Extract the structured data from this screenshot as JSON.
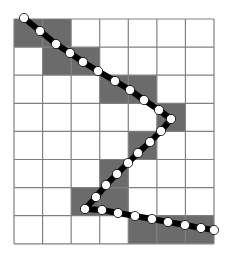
{
  "diagram": {
    "type": "grid-path",
    "grid": {
      "cols": 7,
      "rows": 8,
      "origin_x": 14,
      "origin_y": 19,
      "cell_w": 28.57,
      "cell_h": 28.1,
      "line_color": "#808080",
      "fill_color": "#ffffff",
      "shade_color": "#6b6b6b"
    },
    "shaded_cells": [
      [
        0,
        0
      ],
      [
        0,
        1
      ],
      [
        1,
        1
      ],
      [
        1,
        2
      ],
      [
        2,
        3
      ],
      [
        2,
        4
      ],
      [
        3,
        5
      ],
      [
        4,
        4
      ],
      [
        5,
        3
      ],
      [
        6,
        2
      ],
      [
        6,
        3
      ],
      [
        7,
        4
      ],
      [
        7,
        5
      ],
      [
        7,
        6
      ]
    ],
    "path": {
      "stroke_color": "#000000",
      "stroke_width": 6,
      "dot_fill": "#ffffff",
      "dot_stroke": "#000000",
      "dot_radius": 4.6,
      "points": [
        [
          24,
          18
        ],
        [
          40,
          31
        ],
        [
          56,
          44
        ],
        [
          70,
          53
        ],
        [
          83,
          62
        ],
        [
          98,
          71
        ],
        [
          115,
          81
        ],
        [
          130,
          90
        ],
        [
          144,
          100
        ],
        [
          159,
          110
        ],
        [
          171,
          119
        ],
        [
          161,
          131
        ],
        [
          150,
          142
        ],
        [
          138,
          153
        ],
        [
          128,
          163
        ],
        [
          117,
          174
        ],
        [
          106,
          185
        ],
        [
          96,
          197
        ],
        [
          85,
          209
        ],
        [
          102,
          210
        ],
        [
          118,
          213
        ],
        [
          135,
          216
        ],
        [
          152,
          219
        ],
        [
          168,
          222
        ],
        [
          185,
          225
        ],
        [
          201,
          228
        ],
        [
          214,
          230
        ]
      ]
    }
  }
}
